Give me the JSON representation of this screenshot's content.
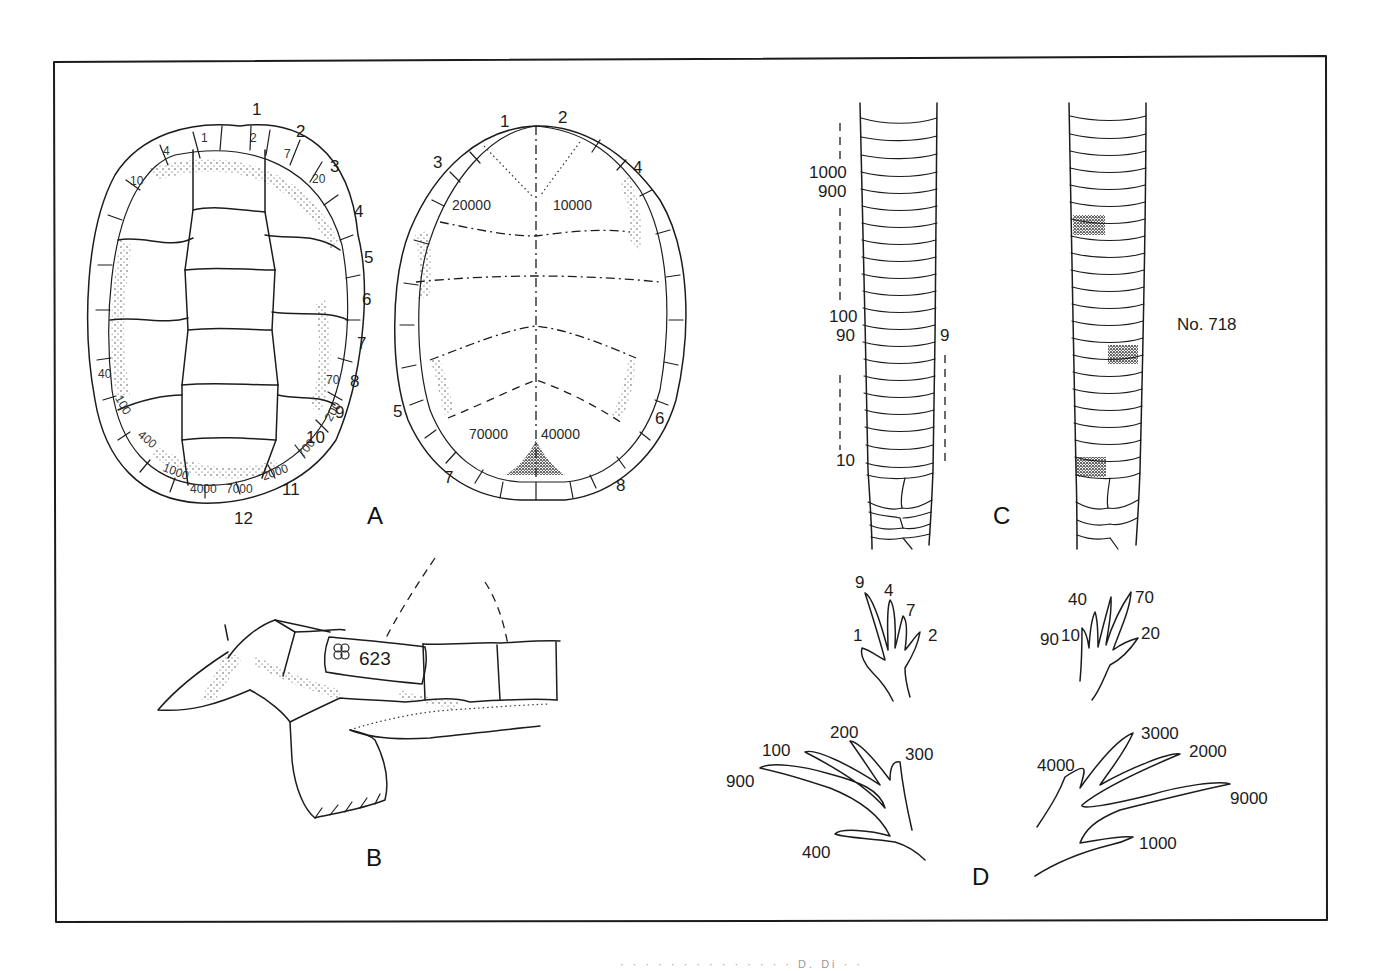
{
  "figure": {
    "panels": {
      "A": {
        "letter": "A",
        "carapace": {
          "marginal_outer_numbers": [
            "1",
            "2",
            "3",
            "4",
            "5",
            "6",
            "7",
            "8",
            "9",
            "10",
            "11",
            "12"
          ],
          "scute_values_right": [
            "1",
            "2",
            "7",
            "20",
            "70",
            "200",
            "700",
            "2000"
          ],
          "scute_values_left": [
            "4",
            "10",
            "40",
            "100",
            "400",
            "1000",
            "4000",
            "7000"
          ]
        },
        "plastron": {
          "marginal_numbers": [
            "1",
            "2",
            "3",
            "4",
            "5",
            "6",
            "7",
            "8"
          ],
          "scute_values": [
            "20000",
            "10000",
            "70000",
            "40000"
          ]
        }
      },
      "B": {
        "letter": "B",
        "tag_number": "623"
      },
      "C": {
        "letter": "C",
        "tail_left_labels": [
          "1000",
          "900",
          "100",
          "90",
          "10"
        ],
        "tail_right_label": "9",
        "specimen_label": "No. 718"
      },
      "D": {
        "letter": "D",
        "front_left_toes": [
          "9",
          "4",
          "7",
          "1",
          "2"
        ],
        "front_right_toes": [
          "40",
          "90",
          "70",
          "10",
          "20"
        ],
        "hind_left_toes": [
          "200",
          "100",
          "300",
          "900",
          "400"
        ],
        "hind_right_toes": [
          "3000",
          "4000",
          "2000",
          "9000",
          "1000"
        ]
      }
    },
    "caption_fragment": "· · ·  · ·   ·  ·  ·   · ·  ·   · ·   ·  D. Di ·  ·"
  }
}
